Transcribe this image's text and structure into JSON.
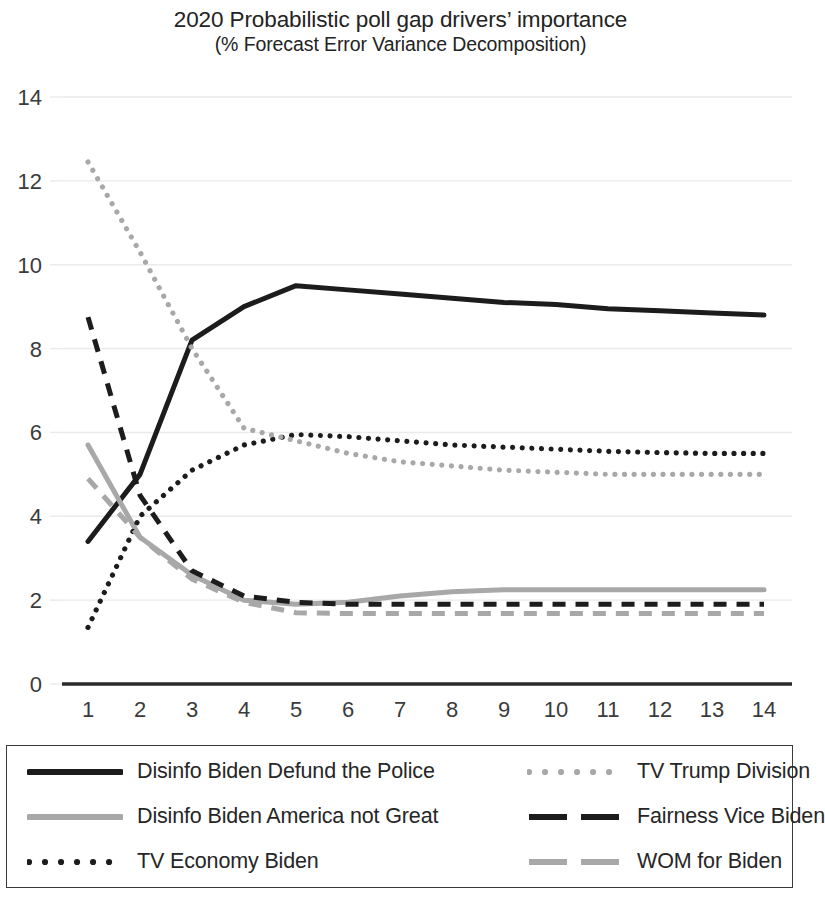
{
  "chart_data": {
    "type": "line",
    "title": "2020 Probabilistic poll gap drivers’ importance",
    "subtitle": "(% Forecast Error Variance Decomposition)",
    "xlabel": "",
    "ylabel": "",
    "x": [
      1,
      2,
      3,
      4,
      5,
      6,
      7,
      8,
      9,
      10,
      11,
      12,
      13,
      14
    ],
    "xtick_labels": [
      "1",
      "2",
      "3",
      "4",
      "5",
      "6",
      "7",
      "8",
      "9",
      "10",
      "11",
      "12",
      "13",
      "14"
    ],
    "ytick_labels": [
      "0",
      "2",
      "4",
      "6",
      "8",
      "10",
      "12",
      "14"
    ],
    "yticks": [
      0,
      2,
      4,
      6,
      8,
      10,
      12,
      14
    ],
    "xlim": [
      0.55,
      14.45
    ],
    "ylim": [
      0,
      14
    ],
    "grid": "horizontal",
    "legend_position": "bottom",
    "series": [
      {
        "name": "Disinfo Biden Defund the Police",
        "color": "#1c1c1c",
        "style": "solid",
        "width": 5.0,
        "values": [
          3.4,
          5.0,
          8.2,
          9.0,
          9.5,
          9.4,
          9.3,
          9.2,
          9.1,
          9.05,
          8.95,
          8.9,
          8.85,
          8.8
        ]
      },
      {
        "name": "Disinfo Biden America not Great",
        "color": "#a8a8a8",
        "style": "solid",
        "width": 5.0,
        "values": [
          5.7,
          3.5,
          2.6,
          2.0,
          1.9,
          1.95,
          2.1,
          2.2,
          2.25,
          2.25,
          2.25,
          2.25,
          2.25,
          2.25
        ]
      },
      {
        "name": "TV Economy Biden",
        "color": "#1c1c1c",
        "style": "dotted",
        "width": 5.2,
        "values": [
          1.35,
          4.0,
          5.1,
          5.7,
          5.95,
          5.9,
          5.8,
          5.7,
          5.65,
          5.6,
          5.55,
          5.52,
          5.5,
          5.5
        ]
      },
      {
        "name": "TV Trump Division",
        "color": "#a8a8a8",
        "style": "dotted",
        "width": 5.2,
        "values": [
          12.45,
          10.3,
          8.0,
          6.1,
          5.8,
          5.5,
          5.3,
          5.2,
          5.1,
          5.05,
          5.0,
          5.0,
          5.0,
          5.0
        ]
      },
      {
        "name": "Fairness Vice Biden",
        "color": "#1c1c1c",
        "style": "dashed",
        "width": 5.0,
        "values": [
          8.75,
          4.5,
          2.7,
          2.1,
          1.95,
          1.9,
          1.9,
          1.9,
          1.9,
          1.9,
          1.9,
          1.9,
          1.9,
          1.9
        ]
      },
      {
        "name": "WOM for Biden",
        "color": "#a8a8a8",
        "style": "dashed",
        "width": 5.0,
        "values": [
          4.9,
          3.5,
          2.5,
          1.95,
          1.7,
          1.68,
          1.68,
          1.68,
          1.68,
          1.68,
          1.68,
          1.68,
          1.68,
          1.68
        ]
      }
    ]
  },
  "legend": {
    "items": [
      {
        "label": "Disinfo Biden Defund the Police",
        "color": "#1c1c1c",
        "style": "solid"
      },
      {
        "label": "TV Trump Division",
        "color": "#a8a8a8",
        "style": "dotted"
      },
      {
        "label": "Disinfo Biden America not Great",
        "color": "#a8a8a8",
        "style": "solid"
      },
      {
        "label": "Fairness Vice Biden",
        "color": "#1c1c1c",
        "style": "dashed"
      },
      {
        "label": "TV Economy Biden",
        "color": "#1c1c1c",
        "style": "dotted"
      },
      {
        "label": "WOM for Biden",
        "color": "#a8a8a8",
        "style": "dashed"
      }
    ]
  },
  "colors": {
    "dark": "#1c1c1c",
    "gray": "#a8a8a8",
    "gridline": "#eceaea",
    "axis": "#2b2b2b",
    "tick_text": "#3b3b3b",
    "title_text": "#232323"
  },
  "axis": {
    "tick_font_size": 22
  }
}
